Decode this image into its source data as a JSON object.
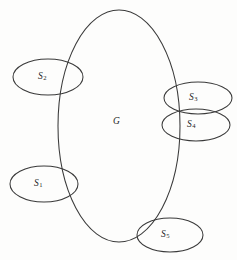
{
  "figure": {
    "kind": "venn-diagram",
    "stroke_color": "#3a3a3a",
    "background_color": "#fdfdfc",
    "text_color": "#1f1f1f"
  },
  "universe": {
    "name": "universe-ellipse",
    "label": "G",
    "cx": 119,
    "cy": 126,
    "rx": 61,
    "ry": 116
  },
  "sets": [
    {
      "id": "s2",
      "name": "set-ellipse-s2",
      "label_base": "S",
      "label_sub": "2",
      "cx": 48,
      "cy": 77,
      "rx": 35,
      "ry": 18,
      "label_x": 38,
      "label_y": 71,
      "position": "upper-left"
    },
    {
      "id": "s1",
      "name": "set-ellipse-s1",
      "label_base": "S",
      "label_sub": "1",
      "cx": 44,
      "cy": 184,
      "rx": 34,
      "ry": 18,
      "label_x": 34,
      "label_y": 178,
      "position": "lower-left"
    },
    {
      "id": "s3",
      "name": "set-ellipse-s3",
      "label_base": "S",
      "label_sub": "3",
      "cx": 198,
      "cy": 98,
      "rx": 34,
      "ry": 16,
      "label_x": 189,
      "label_y": 92,
      "position": "upper-right"
    },
    {
      "id": "s4",
      "name": "set-ellipse-s4",
      "label_base": "S",
      "label_sub": "4",
      "cx": 196,
      "cy": 125,
      "rx": 34,
      "ry": 16,
      "label_x": 187,
      "label_y": 119,
      "position": "mid-right"
    },
    {
      "id": "s5",
      "name": "set-ellipse-s5",
      "label_base": "S",
      "label_sub": "5",
      "cx": 170,
      "cy": 235,
      "rx": 33,
      "ry": 17,
      "label_x": 161,
      "label_y": 229,
      "position": "bottom"
    }
  ],
  "universe_label": {
    "text": "G",
    "x": 113,
    "y": 116
  }
}
